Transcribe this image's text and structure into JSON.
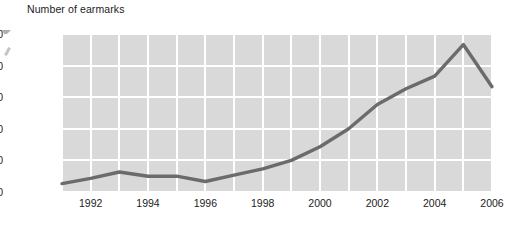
{
  "chart_data": {
    "type": "line",
    "title": "Number of earmarks",
    "xlabel": "",
    "ylabel": "",
    "grid": true,
    "legend": false,
    "xlim": [
      1991,
      2006
    ],
    "ylim": [
      0,
      15000
    ],
    "x_tick_labels": [
      "1992",
      "1994",
      "1996",
      "1998",
      "2000",
      "2002",
      "2004",
      "2006"
    ],
    "x_tick_values": [
      1992,
      1994,
      1996,
      1998,
      2000,
      2002,
      2004,
      2006
    ],
    "y_tick_labels": [
      "0",
      "3,000",
      "6,000",
      "9,000",
      "12,000",
      "15,000"
    ],
    "y_tick_values": [
      0,
      3000,
      6000,
      9000,
      12000,
      15000
    ],
    "x": [
      1991,
      1992,
      1993,
      1994,
      1995,
      1996,
      1997,
      1998,
      1999,
      2000,
      2001,
      2002,
      2003,
      2004,
      2005,
      2006
    ],
    "values": [
      800,
      1300,
      1900,
      1500,
      1500,
      1000,
      1600,
      2200,
      3000,
      4300,
      6000,
      8300,
      9800,
      11000,
      14000,
      10000
    ],
    "series": [
      {
        "name": "Number of earmarks",
        "color": "#6b6b6b",
        "values": [
          800,
          1300,
          1900,
          1500,
          1500,
          1000,
          1600,
          2200,
          3000,
          4300,
          6000,
          8300,
          9800,
          11000,
          14000,
          10000
        ]
      }
    ],
    "colors": {
      "line": "#6b6b6b",
      "plot_background": "#d9d9d9",
      "gridline": "#ffffff",
      "text": "#1c1c1c",
      "page_background": "#ffffff"
    }
  }
}
